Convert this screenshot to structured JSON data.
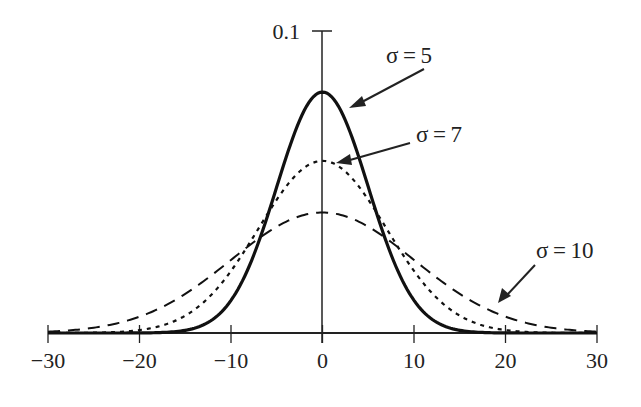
{
  "chart_data": {
    "type": "line",
    "title": "",
    "xlabel": "",
    "ylabel": "",
    "xlim": [
      -30,
      30
    ],
    "ylim": [
      0,
      0.1
    ],
    "grid": false,
    "legend_position": "inline annotations with arrows",
    "x_ticks": [
      -30,
      -20,
      -10,
      0,
      10,
      20,
      30
    ],
    "x_tick_labels": [
      "−30",
      "−20",
      "−10",
      "0",
      "10",
      "20",
      "30"
    ],
    "y_ticks": [
      0.1
    ],
    "y_tick_labels": [
      "0.1"
    ],
    "series": [
      {
        "name": "σ = 5",
        "mean": 0,
        "sigma": 5,
        "peak": 0.0798,
        "style": "solid",
        "annotation": "σ = 5"
      },
      {
        "name": "σ = 7",
        "mean": 0,
        "sigma": 7,
        "peak": 0.057,
        "style": "dotted",
        "annotation": "σ = 7"
      },
      {
        "name": "σ = 10",
        "mean": 0,
        "sigma": 10,
        "peak": 0.0399,
        "style": "dashed",
        "annotation": "σ = 10"
      }
    ],
    "annotations": [
      {
        "text": "σ = 5",
        "series": 0
      },
      {
        "text": "σ = 7",
        "series": 1
      },
      {
        "text": "σ = 10",
        "series": 2
      }
    ]
  }
}
